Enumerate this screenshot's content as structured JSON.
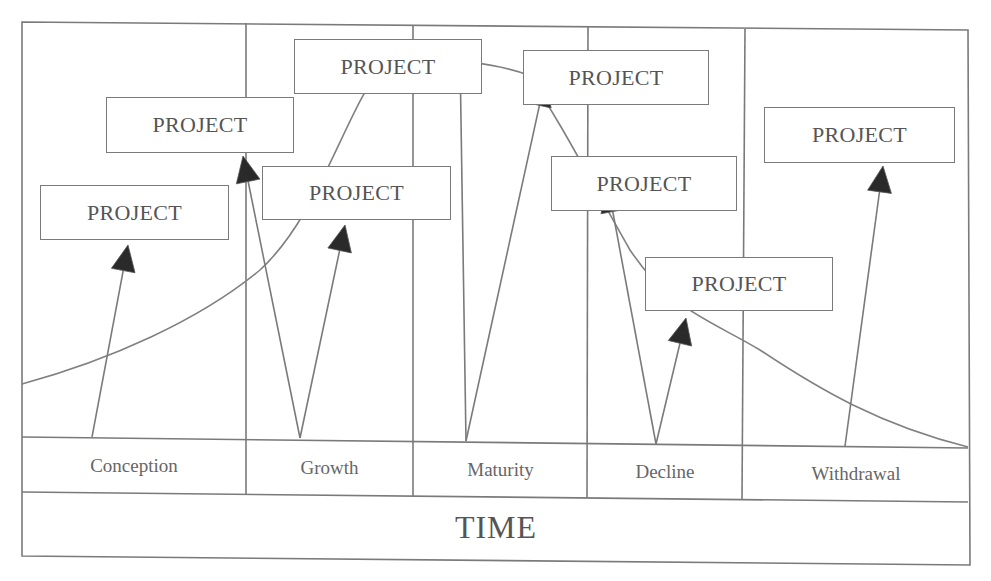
{
  "diagram": {
    "type": "project lifecycle diagram",
    "axis_label": "TIME",
    "stages": [
      {
        "label": "Conception",
        "x": 22,
        "w": 224
      },
      {
        "label": "Growth",
        "x": 246,
        "w": 167
      },
      {
        "label": "Maturity",
        "x": 413,
        "w": 175
      },
      {
        "label": "Decline",
        "x": 588,
        "w": 154
      },
      {
        "label": "Withdrawal",
        "x": 742,
        "w": 228
      }
    ],
    "projects": [
      {
        "label": "PROJECT",
        "stage": "Conception",
        "x": 40,
        "y": 185,
        "w": 189,
        "h": 55
      },
      {
        "label": "PROJECT",
        "stage": "Growth",
        "x": 106,
        "y": 97,
        "w": 188,
        "h": 56
      },
      {
        "label": "PROJECT",
        "stage": "Maturity",
        "x": 294,
        "y": 39,
        "w": 188,
        "h": 55
      },
      {
        "label": "PROJECT",
        "stage": "Growth",
        "x": 262,
        "y": 166,
        "w": 189,
        "h": 54
      },
      {
        "label": "PROJECT",
        "stage": "Maturity",
        "x": 523,
        "y": 50,
        "w": 186,
        "h": 55
      },
      {
        "label": "PROJECT",
        "stage": "Decline",
        "x": 551,
        "y": 156,
        "w": 186,
        "h": 55
      },
      {
        "label": "PROJECT",
        "stage": "Decline",
        "x": 645,
        "y": 257,
        "w": 188,
        "h": 54
      },
      {
        "label": "PROJECT",
        "stage": "Withdrawal",
        "x": 764,
        "y": 107,
        "w": 191,
        "h": 56
      }
    ],
    "arrows": [
      {
        "from_stage": "Conception",
        "x1": 92,
        "y1": 437,
        "x2": 128,
        "y2": 245
      },
      {
        "from_stage": "Growth",
        "x1": 300,
        "y1": 438,
        "x2": 243,
        "y2": 156
      },
      {
        "from_stage": "Growth",
        "x1": 300,
        "y1": 438,
        "x2": 345,
        "y2": 225
      },
      {
        "from_stage": "Maturity",
        "x1": 466,
        "y1": 441,
        "x2": 460,
        "y2": 56
      },
      {
        "from_stage": "Maturity",
        "x1": 466,
        "y1": 441,
        "x2": 545,
        "y2": 80
      },
      {
        "from_stage": "Decline",
        "x1": 656,
        "y1": 444,
        "x2": 608,
        "y2": 186
      },
      {
        "from_stage": "Decline",
        "x1": 656,
        "y1": 444,
        "x2": 686,
        "y2": 318
      },
      {
        "from_stage": "Withdrawal",
        "x1": 845,
        "y1": 446,
        "x2": 883,
        "y2": 166
      }
    ],
    "curve_description": "bell-shaped lifecycle curve rising through Conception and Growth, peaking in Maturity, descending through Decline and Withdrawal",
    "colors": {
      "line": "#7a7a7a",
      "arrowhead": "#2a2a2a",
      "text": "#555555",
      "background": "#ffffff"
    }
  }
}
